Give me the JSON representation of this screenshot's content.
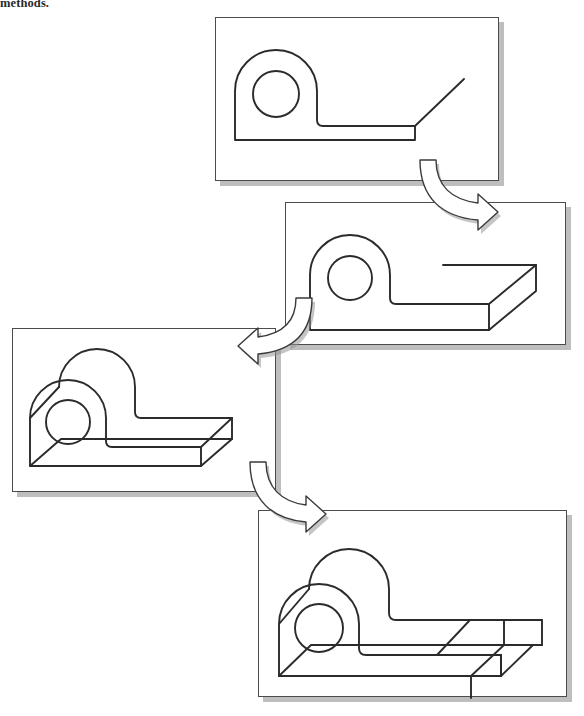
{
  "caption": {
    "text": "methods."
  },
  "figure": {
    "background_color": "#ffffff",
    "line_color": "#2b2b2b",
    "panel_border_color": "#4b4b4b",
    "shadow_color": "#969696",
    "arrow_fill": "#ffffff",
    "arrow_stroke": "#3a3a3a"
  },
  "panels": [
    {
      "id": "panel-1",
      "step": 1,
      "label": "Sketched profile with extrusion direction",
      "x": 215,
      "y": 17,
      "width": 284,
      "height": 164
    },
    {
      "id": "panel-2",
      "step": 2,
      "label": "Profile extruded to thin base plate",
      "x": 285,
      "y": 202,
      "width": 281,
      "height": 143
    },
    {
      "id": "panel-3",
      "step": 3,
      "label": "Solid extruded with boss and base",
      "x": 12,
      "y": 328,
      "width": 264,
      "height": 164
    },
    {
      "id": "panel-4",
      "step": 4,
      "label": "Final part with cut slot in base",
      "x": 258,
      "y": 510,
      "width": 309,
      "height": 187
    }
  ],
  "arrows": [
    {
      "id": "arrow-1",
      "label": "step 1 to step 2",
      "from_panel": "panel-1",
      "to_panel": "panel-2",
      "direction": "down-left",
      "x": 424,
      "y": 156
    },
    {
      "id": "arrow-2",
      "label": "step 2 to step 3",
      "from_panel": "panel-2",
      "to_panel": "panel-3",
      "direction": "down-left",
      "x": 234,
      "y": 294
    },
    {
      "id": "arrow-3",
      "label": "step 3 to step 4",
      "from_panel": "panel-3",
      "to_panel": "panel-4",
      "direction": "down-right",
      "x": 258,
      "y": 458
    }
  ]
}
